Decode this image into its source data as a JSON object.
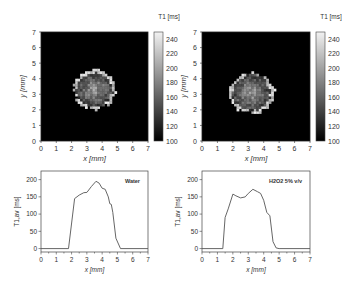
{
  "figure": {
    "panels": [
      {
        "id": "a",
        "label": "Water"
      },
      {
        "id": "b",
        "label": "H2O2 5% v/v"
      }
    ]
  },
  "chart_data": [
    {
      "type": "heatmap",
      "title": "",
      "xlabel": "x [mm]",
      "ylabel": "y [mm]",
      "xlim": [
        0,
        7
      ],
      "ylim": [
        0,
        7
      ],
      "xticks": [
        0,
        1,
        2,
        3,
        4,
        5,
        6,
        7
      ],
      "yticks": [
        0,
        1,
        2,
        3,
        4,
        5,
        6,
        7
      ],
      "colorbar": {
        "label": "T1 [ms]",
        "range": [
          100,
          250
        ],
        "ticks": [
          100,
          120,
          140,
          160,
          180,
          200,
          220,
          240
        ]
      },
      "description": "Roughly circular region centred near (3.5, 3.3) mm, radius ~1.3 mm, values ~150-240 ms with bright rim; background 100 ms",
      "blob": {
        "cx": 3.5,
        "cy": 3.3,
        "rx": 1.35,
        "ry": 1.25
      }
    },
    {
      "type": "heatmap",
      "title": "",
      "xlabel": "x [mm]",
      "ylabel": "y [mm]",
      "xlim": [
        0,
        7
      ],
      "ylim": [
        0,
        7
      ],
      "xticks": [
        0,
        1,
        2,
        3,
        4,
        5,
        6,
        7
      ],
      "yticks": [
        0,
        1,
        2,
        3,
        4,
        5,
        6,
        7
      ],
      "colorbar": {
        "label": "T1 [ms]",
        "range": [
          100,
          250
        ],
        "ticks": [
          100,
          120,
          140,
          160,
          180,
          200,
          220,
          240
        ]
      },
      "description": "Roughly circular region centred near (3.2, 3.1) mm, radius ~1.4 mm, values ~140-220 ms with bright rim; background 100 ms",
      "blob": {
        "cx": 3.2,
        "cy": 3.1,
        "rx": 1.45,
        "ry": 1.3
      }
    },
    {
      "type": "line",
      "title": "",
      "legend": "Water",
      "xlabel": "x [mm]",
      "ylabel": "T1,av [ms]",
      "xlim": [
        0,
        7
      ],
      "ylim": [
        -10,
        225
      ],
      "xticks": [
        0,
        1,
        2,
        3,
        4,
        5,
        6,
        7
      ],
      "yticks": [
        0,
        50,
        100,
        150,
        200
      ],
      "x": [
        0,
        1.8,
        2.2,
        2.5,
        2.8,
        3.0,
        3.3,
        3.6,
        3.8,
        4.0,
        4.2,
        4.4,
        4.5,
        4.6,
        4.7,
        4.9,
        5.2,
        7
      ],
      "y": [
        0,
        0,
        145,
        155,
        162,
        163,
        180,
        195,
        190,
        175,
        172,
        150,
        130,
        128,
        105,
        30,
        0,
        0
      ]
    },
    {
      "type": "line",
      "title": "",
      "legend": "H2O2 5% v/v",
      "xlabel": "x [mm]",
      "ylabel": "T1,av [ms]",
      "xlim": [
        0,
        7
      ],
      "ylim": [
        -10,
        225
      ],
      "xticks": [
        0,
        1,
        2,
        3,
        4,
        5,
        6,
        7
      ],
      "yticks": [
        0,
        50,
        100,
        150,
        200
      ],
      "x": [
        0,
        1.35,
        1.5,
        1.7,
        2.0,
        2.2,
        2.5,
        2.8,
        3.0,
        3.3,
        3.6,
        3.8,
        4.0,
        4.2,
        4.4,
        4.6,
        4.8,
        5.0,
        7
      ],
      "y": [
        0,
        0,
        90,
        115,
        158,
        153,
        147,
        150,
        160,
        172,
        165,
        160,
        140,
        105,
        95,
        20,
        2,
        0,
        0
      ]
    }
  ]
}
